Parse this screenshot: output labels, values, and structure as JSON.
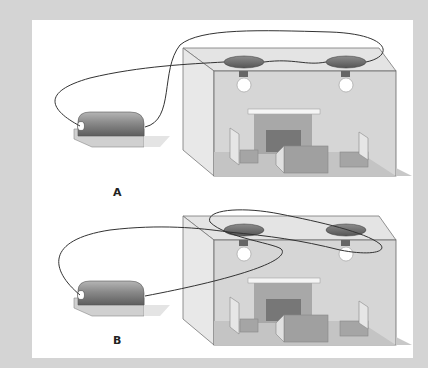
{
  "figure": {
    "panels": [
      {
        "label": "A",
        "wiring": "series"
      },
      {
        "label": "B",
        "wiring": "parallel"
      }
    ]
  },
  "colors": {
    "frame": "#d4d4d4",
    "panel": "#ffffff",
    "room": "#dcdcdc",
    "wire": "#333333"
  }
}
